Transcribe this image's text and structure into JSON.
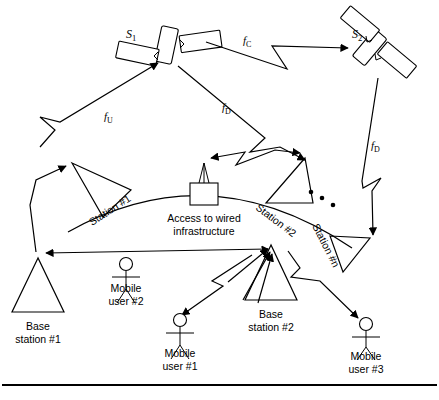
{
  "diagram": {
    "satellites": [
      {
        "id": "s1",
        "label": "S",
        "subscript": "1",
        "name": "satellite-1"
      },
      {
        "id": "s2",
        "label": "S",
        "subscript": "2",
        "name": "satellite-2"
      }
    ],
    "frequencies": [
      {
        "id": "fu",
        "label": "f",
        "subscript": "U",
        "meaning": "uplink-frequency"
      },
      {
        "id": "fd1",
        "label": "f",
        "subscript": "D",
        "meaning": "downlink-frequency"
      },
      {
        "id": "fc",
        "label": "f",
        "subscript": "C",
        "meaning": "crosslink-frequency"
      },
      {
        "id": "fd2",
        "label": "f",
        "subscript": "D",
        "meaning": "downlink-frequency"
      }
    ],
    "stations": [
      {
        "id": "station1",
        "label": "Station #1"
      },
      {
        "id": "station2",
        "label": "Station #2"
      },
      {
        "id": "stationn",
        "label": "Station #n"
      }
    ],
    "access": {
      "line1": "Access to wired",
      "line2": "infrastructure"
    },
    "nodes": [
      {
        "id": "base1",
        "line1": "Base",
        "line2": "station #1",
        "type": "base-station"
      },
      {
        "id": "base2",
        "line1": "Base",
        "line2": "station #2",
        "type": "base-station"
      },
      {
        "id": "user1",
        "line1": "Mobile",
        "line2": "user #1",
        "type": "mobile-user"
      },
      {
        "id": "user2",
        "line1": "Mobile",
        "line2": "user #2",
        "type": "mobile-user"
      },
      {
        "id": "user3",
        "line1": "Mobile",
        "line2": "user #3",
        "type": "mobile-user"
      }
    ],
    "ellipsis": "...",
    "colors": {
      "ink": "#000000",
      "paper": "#ffffff"
    }
  }
}
